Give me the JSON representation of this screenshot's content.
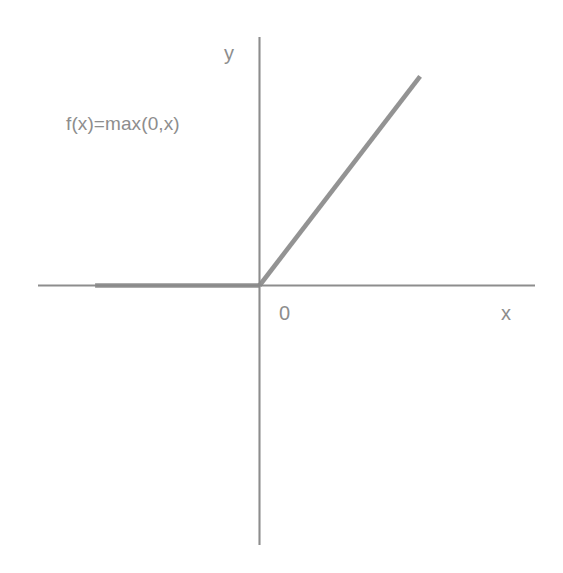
{
  "figure": {
    "background_color": "#ffffff",
    "axis_color": "#8d8d8d",
    "curve_color": "#8a8a8a",
    "text_color": "#8d8d8d"
  },
  "labels": {
    "y_axis": "y",
    "x_axis": "x",
    "origin": "0",
    "formula": "f(x)=max(0,x)"
  },
  "chart_data": {
    "type": "line",
    "title": "",
    "subtitle": "",
    "xlabel": "x",
    "ylabel": "y",
    "annotations": [
      {
        "text": "f(x)=max(0,x)",
        "x": -4.1,
        "y": 3.3
      },
      {
        "text": "0",
        "x": 0.25,
        "y": -0.35
      }
    ],
    "legend": [],
    "legend_position": "none",
    "grid": false,
    "xlim": [
      -5.8,
      7.2
    ],
    "ylim": [
      -5.2,
      5.0
    ],
    "axis_origin": [
      0,
      0
    ],
    "tick_labels": {
      "x": [
        "0"
      ],
      "y": []
    },
    "series": [
      {
        "name": "f(x)=max(0,x)",
        "color": "#8a8a8a",
        "x": [
          -4.3,
          0,
          4.2
        ],
        "y": [
          0,
          0,
          4.2
        ]
      }
    ]
  }
}
